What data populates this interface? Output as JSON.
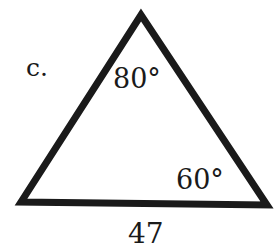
{
  "problem": {
    "label": "c.",
    "figure": "triangle",
    "angles": {
      "top": "80°",
      "bottom_right": "60°"
    },
    "side_bottom": "47"
  },
  "colors": {
    "stroke": "#1a1a1a",
    "background": "#ffffff"
  }
}
